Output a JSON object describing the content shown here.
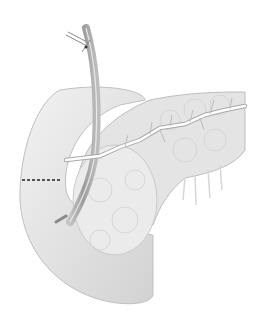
{
  "illustration": {
    "subject": "pancreas with duodenum, pancreatic duct and inserted catheter",
    "colors": {
      "background": "#ffffff",
      "tissue": "#e6e6e6",
      "tissue_shadow": "#c8c8c8",
      "outline": "#b4b4b4",
      "tube": "#9a9a9a",
      "duct": "#ffffff",
      "cut_line": "#222222"
    }
  }
}
